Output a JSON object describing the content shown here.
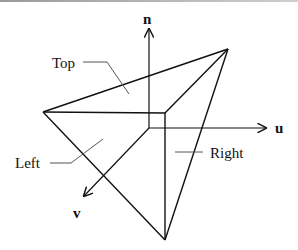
{
  "diagram": {
    "title": "",
    "axes": {
      "n": "n",
      "u": "u",
      "v": "v"
    },
    "faces": {
      "top": "Top",
      "left": "Left",
      "right": "Right"
    },
    "colors": {
      "line": "#111111",
      "leader": "#555555",
      "background": "#ffffff"
    }
  }
}
